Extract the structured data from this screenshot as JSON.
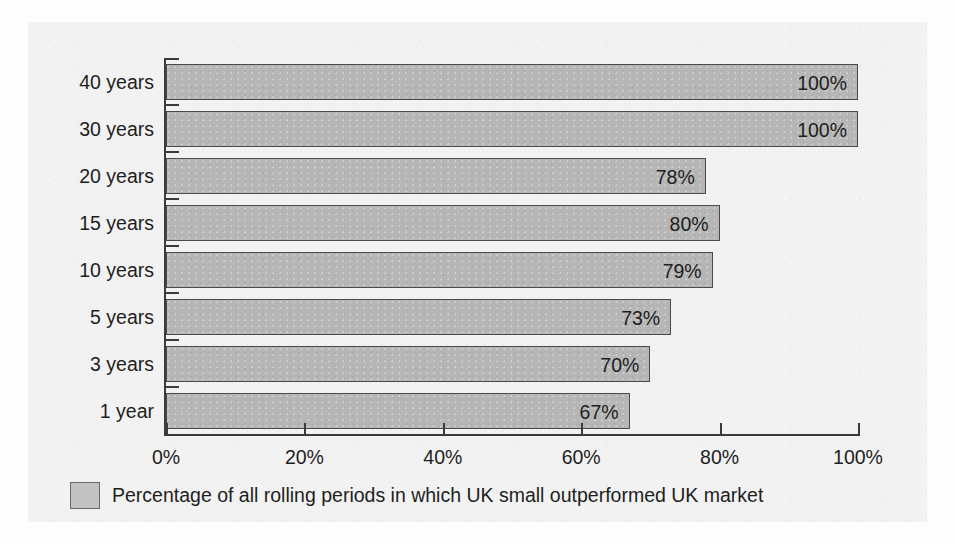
{
  "chart_data": {
    "type": "bar",
    "orientation": "horizontal",
    "title": "",
    "subtitle": "",
    "xlabel": "",
    "ylabel": "",
    "xlim": [
      0,
      100
    ],
    "grid": false,
    "legend_position": "bottom-left",
    "categories": [
      "40 years",
      "30 years",
      "20 years",
      "15 years",
      "10 years",
      "5 years",
      "3 years",
      "1 year"
    ],
    "values": [
      100,
      100,
      78,
      80,
      79,
      73,
      70,
      67
    ],
    "data_labels": [
      "100%",
      "100%",
      "78%",
      "80%",
      "79%",
      "73%",
      "70%",
      "67%"
    ],
    "xtick_values": [
      0,
      20,
      40,
      60,
      80,
      100
    ],
    "xtick_labels": [
      "0%",
      "20%",
      "40%",
      "60%",
      "80%",
      "100%"
    ],
    "series": [
      {
        "name": "Percentage of all rolling periods in which UK small outperformed UK market",
        "values": [
          100,
          100,
          78,
          80,
          79,
          73,
          70,
          67
        ]
      }
    ]
  },
  "legend": {
    "swatch_name": "legend-swatch-grey",
    "label": "Percentage of all rolling periods in which UK small outperformed UK market"
  },
  "colors": {
    "bar_fill": "#b6b6b6",
    "bar_border": "#4a4a4a",
    "axis": "#3b3b3b",
    "text": "#1e1e1e",
    "panel_background": "#f2f2f2",
    "page_background": "#fdfdfd"
  }
}
